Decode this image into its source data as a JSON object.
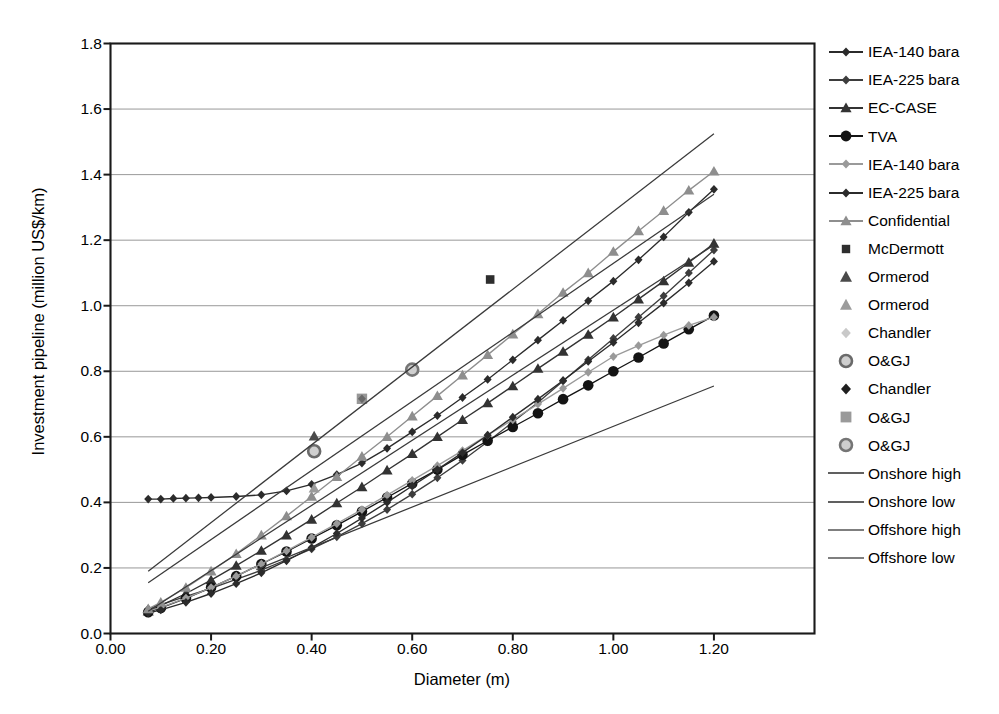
{
  "chart_data": {
    "type": "scatter",
    "title": "",
    "xlabel": "Diameter (m)",
    "ylabel": "Investment pipeline (million US$/km)",
    "xlim": [
      0.0,
      1.4
    ],
    "ylim": [
      0.0,
      1.8
    ],
    "xticks": [
      "0.00",
      "0.20",
      "0.40",
      "0.60",
      "0.80",
      "1.00",
      "1.20"
    ],
    "xtick_values": [
      0.0,
      0.2,
      0.4,
      0.6,
      0.8,
      1.0,
      1.2
    ],
    "yticks": [
      "0.0",
      "0.2",
      "0.4",
      "0.6",
      "0.8",
      "1.0",
      "1.2",
      "1.4",
      "1.6",
      "1.8"
    ],
    "ytick_values": [
      0.0,
      0.2,
      0.4,
      0.6,
      0.8,
      1.0,
      1.2,
      1.4,
      1.6,
      1.8
    ],
    "grid": "horizontal",
    "legend_position": "right",
    "series": [
      {
        "name": "IEA-140 bara",
        "marker": "diamond-small",
        "color": "#2b2b2b",
        "line": true,
        "x": [
          0.075,
          0.1,
          0.125,
          0.15,
          0.175,
          0.2,
          0.25,
          0.3,
          0.35,
          0.4,
          0.45,
          0.5,
          0.55,
          0.6,
          0.65,
          0.7,
          0.75,
          0.8,
          0.85,
          0.9,
          0.95,
          1.0,
          1.05,
          1.1,
          1.15,
          1.2
        ],
        "y": [
          0.41,
          0.41,
          0.412,
          0.413,
          0.414,
          0.415,
          0.418,
          0.423,
          0.435,
          0.455,
          0.485,
          0.52,
          0.565,
          0.615,
          0.665,
          0.72,
          0.775,
          0.835,
          0.895,
          0.955,
          1.015,
          1.075,
          1.14,
          1.21,
          1.285,
          1.355
        ]
      },
      {
        "name": "IEA-225 bara",
        "marker": "diamond-small",
        "color": "#3d3d3d",
        "line": true,
        "x": [
          0.075,
          0.1,
          0.15,
          0.2,
          0.25,
          0.3,
          0.35,
          0.4,
          0.45,
          0.5,
          0.55,
          0.6,
          0.65,
          0.7,
          0.75,
          0.8,
          0.85,
          0.9,
          0.95,
          1.0,
          1.05,
          1.1,
          1.15,
          1.2
        ],
        "y": [
          0.075,
          0.088,
          0.113,
          0.138,
          0.165,
          0.193,
          0.225,
          0.258,
          0.295,
          0.335,
          0.378,
          0.425,
          0.475,
          0.528,
          0.585,
          0.645,
          0.705,
          0.77,
          0.835,
          0.9,
          0.965,
          1.03,
          1.1,
          1.17
        ]
      },
      {
        "name": "EC-CASE",
        "marker": "triangle",
        "color": "#333333",
        "line": true,
        "x": [
          0.075,
          0.1,
          0.15,
          0.2,
          0.25,
          0.3,
          0.35,
          0.4,
          0.45,
          0.5,
          0.55,
          0.6,
          0.65,
          0.7,
          0.75,
          0.8,
          0.85,
          0.9,
          0.95,
          1.0,
          1.05,
          1.1,
          1.15,
          1.2
        ],
        "y": [
          0.068,
          0.085,
          0.122,
          0.163,
          0.207,
          0.253,
          0.3,
          0.348,
          0.398,
          0.447,
          0.498,
          0.548,
          0.6,
          0.652,
          0.703,
          0.755,
          0.808,
          0.86,
          0.912,
          0.965,
          1.02,
          1.075,
          1.132,
          1.19
        ]
      },
      {
        "name": "TVA",
        "marker": "circle",
        "color": "#141414",
        "line": true,
        "x": [
          0.075,
          0.1,
          0.15,
          0.2,
          0.25,
          0.3,
          0.35,
          0.4,
          0.45,
          0.5,
          0.55,
          0.6,
          0.65,
          0.7,
          0.75,
          0.8,
          0.85,
          0.9,
          0.95,
          1.0,
          1.05,
          1.1,
          1.15,
          1.2
        ],
        "y": [
          0.065,
          0.078,
          0.107,
          0.14,
          0.175,
          0.212,
          0.25,
          0.29,
          0.33,
          0.372,
          0.415,
          0.458,
          0.5,
          0.545,
          0.588,
          0.63,
          0.672,
          0.715,
          0.757,
          0.8,
          0.842,
          0.885,
          0.928,
          0.97
        ]
      },
      {
        "name": "IEA-140 bara",
        "marker": "diamond-small",
        "color": "#9a9a9a",
        "line": true,
        "x": [
          0.075,
          0.1,
          0.15,
          0.2,
          0.25,
          0.3,
          0.35,
          0.4,
          0.45,
          0.5,
          0.55,
          0.6,
          0.65,
          0.7,
          0.75,
          0.8,
          0.85,
          0.9,
          0.95,
          1.0,
          1.05,
          1.1,
          1.15,
          1.2
        ],
        "y": [
          0.068,
          0.08,
          0.108,
          0.14,
          0.175,
          0.212,
          0.252,
          0.293,
          0.335,
          0.378,
          0.422,
          0.467,
          0.512,
          0.558,
          0.605,
          0.652,
          0.7,
          0.748,
          0.797,
          0.845,
          0.878,
          0.91,
          0.94,
          0.965
        ]
      },
      {
        "name": "IEA-225 bara",
        "marker": "diamond-small",
        "color": "#2b2b2b",
        "line": true,
        "x": [
          0.075,
          0.1,
          0.15,
          0.2,
          0.25,
          0.3,
          0.35,
          0.4,
          0.45,
          0.5,
          0.55,
          0.6,
          0.65,
          0.7,
          0.75,
          0.8,
          0.85,
          0.9,
          0.95,
          1.0,
          1.05,
          1.1,
          1.15,
          1.2
        ],
        "y": [
          0.062,
          0.072,
          0.095,
          0.122,
          0.152,
          0.185,
          0.222,
          0.262,
          0.305,
          0.352,
          0.4,
          0.45,
          0.5,
          0.552,
          0.605,
          0.66,
          0.715,
          0.772,
          0.83,
          0.888,
          0.948,
          1.008,
          1.07,
          1.135
        ]
      },
      {
        "name": "Confidential",
        "marker": "triangle",
        "color": "#8e8e8e",
        "line": true,
        "x": [
          0.075,
          0.1,
          0.15,
          0.2,
          0.25,
          0.3,
          0.35,
          0.4,
          0.45,
          0.5,
          0.55,
          0.6,
          0.65,
          0.7,
          0.75,
          0.8,
          0.85,
          0.9,
          0.95,
          1.0,
          1.05,
          1.1,
          1.15,
          1.2
        ],
        "y": [
          0.075,
          0.095,
          0.14,
          0.19,
          0.243,
          0.3,
          0.358,
          0.418,
          0.478,
          0.54,
          0.6,
          0.663,
          0.725,
          0.788,
          0.85,
          0.913,
          0.975,
          1.04,
          1.1,
          1.165,
          1.228,
          1.29,
          1.352,
          1.41
        ]
      },
      {
        "name": "McDermott",
        "marker": "square",
        "color": "#2e2e2e",
        "line": false,
        "x": [
          0.755
        ],
        "y": [
          1.08
        ]
      },
      {
        "name": "Ormerod",
        "marker": "triangle",
        "color": "#4a4a4a",
        "line": false,
        "x": [
          0.405
        ],
        "y": [
          0.602
        ]
      },
      {
        "name": "Ormerod",
        "marker": "triangle",
        "color": "#9c9c9c",
        "line": false,
        "x": [
          0.405
        ],
        "y": [
          0.443
        ]
      },
      {
        "name": "Chandler",
        "marker": "diamond-small",
        "color": "#c2c2c2",
        "line": false,
        "x": [
          0.405
        ],
        "y": [
          0.556
        ]
      },
      {
        "name": "O&GJ",
        "marker": "circle-ring",
        "color": "#6a6a6a",
        "line": false,
        "x": [
          0.405
        ],
        "y": [
          0.556
        ]
      },
      {
        "name": "Chandler",
        "marker": "diamond-small",
        "color": "#1f1f1f",
        "line": false,
        "x": [
          0.5
        ],
        "y": [
          0.716
        ]
      },
      {
        "name": "O&GJ",
        "marker": "square-blur",
        "color": "#7d7d7d",
        "line": false,
        "x": [
          0.5
        ],
        "y": [
          0.716
        ]
      },
      {
        "name": "O&GJ",
        "marker": "circle-ring",
        "color": "#757575",
        "line": false,
        "x": [
          0.6
        ],
        "y": [
          0.805
        ]
      },
      {
        "name": "Onshore high",
        "marker": "none",
        "color": "#3a3a3a",
        "line": true,
        "x": [
          0.075,
          1.2
        ],
        "y": [
          0.19,
          1.525
        ]
      },
      {
        "name": "Onshore low",
        "marker": "none",
        "color": "#3a3a3a",
        "line": true,
        "x": [
          0.075,
          1.2
        ],
        "y": [
          0.155,
          1.34
        ]
      },
      {
        "name": "Offshore high",
        "marker": "none",
        "color": "#3a3a3a",
        "line": true,
        "x": [
          0.075,
          1.2
        ],
        "y": [
          0.068,
          1.185
        ]
      },
      {
        "name": "Offshore low",
        "marker": "none",
        "color": "#3a3a3a",
        "line": true,
        "x": [
          0.29,
          1.2
        ],
        "y": [
          0.195,
          0.755
        ]
      }
    ]
  },
  "axes": {
    "ylabel": "Investment pipeline (million US$/km)",
    "xlabel": "Diameter (m)"
  },
  "legend": {
    "items": [
      {
        "label": "IEA-140 bara",
        "key": "line-diamond",
        "color": "#2b2b2b"
      },
      {
        "label": "IEA-225 bara",
        "key": "line-diamond-small",
        "color": "#3d3d3d"
      },
      {
        "label": "EC-CASE",
        "key": "line-triangle",
        "color": "#333333"
      },
      {
        "label": "TVA",
        "key": "line-circle",
        "color": "#141414"
      },
      {
        "label": "IEA-140 bara",
        "key": "line-diamond-grey",
        "color": "#9a9a9a"
      },
      {
        "label": "IEA-225 bara",
        "key": "line-diamond",
        "color": "#2b2b2b"
      },
      {
        "label": "Confidential",
        "key": "line-triangle-grey",
        "color": "#8e8e8e"
      },
      {
        "label": "McDermott",
        "key": "square",
        "color": "#2e2e2e"
      },
      {
        "label": "Ormerod",
        "key": "triangle",
        "color": "#4a4a4a"
      },
      {
        "label": "Ormerod",
        "key": "triangle-grey",
        "color": "#9c9c9c"
      },
      {
        "label": "Chandler",
        "key": "diamond-pale",
        "color": "#c9c9c9"
      },
      {
        "label": "O&GJ",
        "key": "circle-ring",
        "color": "#6a6a6a"
      },
      {
        "label": "Chandler",
        "key": "diamond-dark",
        "color": "#1f1f1f"
      },
      {
        "label": "O&GJ",
        "key": "square-blur",
        "color": "#7d7d7d"
      },
      {
        "label": "O&GJ",
        "key": "circle-ring2",
        "color": "#757575"
      },
      {
        "label": "Onshore high",
        "key": "plain-line",
        "color": "#2b2b2b"
      },
      {
        "label": "Onshore low",
        "key": "plain-line",
        "color": "#2b2b2b"
      },
      {
        "label": "Offshore high",
        "key": "plain-line",
        "color": "#555555"
      },
      {
        "label": "Offshore low",
        "key": "plain-line",
        "color": "#555555"
      }
    ]
  }
}
